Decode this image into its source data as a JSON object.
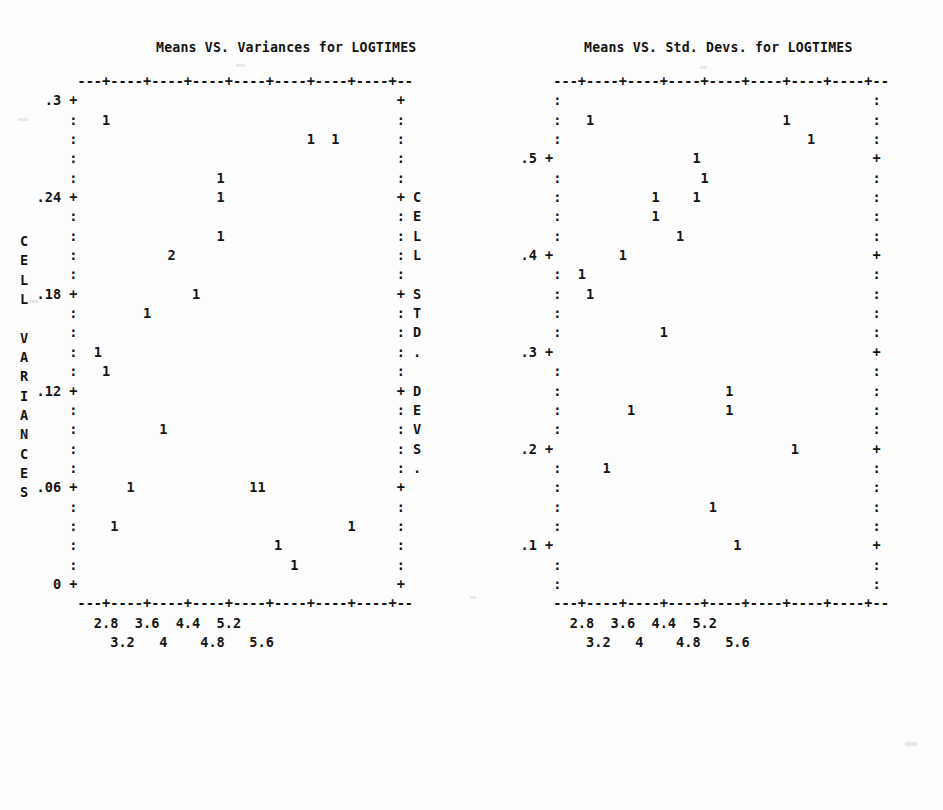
{
  "page": {
    "background_color": "#fdfdfd",
    "ink_color": "#141414",
    "width": 943,
    "height": 810,
    "style": "ascii character plot printout"
  },
  "panels": [
    {
      "id": "left",
      "title": "Means VS. Variances for LOGTIMES",
      "y_axis_label": "CELL VARIANCES",
      "x_axis_label": "",
      "y_ticks": [
        ".3",
        ".24",
        ".18",
        ".12",
        ".06",
        "0"
      ],
      "x_ticks_upper": [
        "2.8",
        "3.6",
        "4.4",
        "5.2"
      ],
      "x_ticks_lower": [
        "3.2",
        "4",
        "4.8",
        "5.6"
      ],
      "plot_text": [
        "        ---+----+----+----+----+----+----+----+--",
        "    .3 +                                       +",
        "       :   1                                   :",
        "       :                            1  1       :",
        "       :                                       :",
        "       :                 1                     :",
        "   .24 +                 1                     + C",
        "       :                                       : E",
        "       :                 1                     : L",
        "       :           2                           : L",
        "       :                                       :",
        "   .18 +              1                        + S",
        "       :        1                              : T",
        "       :                                       : D",
        "       :  1                                    : .",
        "       :   1                                   :",
        "   .12 +                                       + D",
        "       :                                       : E",
        "       :          1                            : V",
        "       :                                       : S",
        "       :                                       : .",
        "   .06 +      1              11                +",
        "       :                                       :",
        "       :    1                            1     :",
        "       :                        1              :",
        "       :                          1            :",
        "     0 +                                       +",
        "        ---+----+----+----+----+----+----+----+--",
        "          2.8  3.6  4.4  5.2",
        "            3.2   4    4.8   5.6"
      ]
    },
    {
      "id": "right",
      "title": "Means VS. Std. Devs. for LOGTIMES",
      "y_axis_label": "",
      "x_axis_label": "",
      "y_ticks": [
        ".5",
        ".4",
        ".3",
        ".2",
        ".1"
      ],
      "x_ticks_upper": [
        "2.8",
        "3.6",
        "4.4",
        "5.2"
      ],
      "x_ticks_lower": [
        "3.2",
        "4",
        "4.8",
        "5.6"
      ],
      "plot_text": [
        "       ---+----+----+----+----+----+----+----+--",
        "       :                                      :",
        "       :   1                       1          :",
        "       :                              1       :",
        "   .5 +                 1                     +",
        "       :                 1                    :",
        "       :           1    1                     :",
        "       :           1                          :",
        "       :              1                       :",
        "   .4 +        1                              +",
        "       :  1                                   :",
        "       :   1                                  :",
        "       :                                      :",
        "       :            1                         :",
        "   .3 +                                       +",
        "       :                                      :",
        "       :                    1                 :",
        "       :        1           1                 :",
        "       :                                      :",
        "   .2 +                             1         +",
        "       :     1                                :",
        "       :                                      :",
        "       :                  1                   :",
        "       :                                      :",
        "   .1 +                      1                +",
        "       :                                      :",
        "       :                                      :",
        "       ---+----+----+----+----+----+----+----+--",
        "         2.8  3.6  4.4  5.2",
        "           3.2   4    4.8   5.6"
      ]
    }
  ],
  "chart_data": [
    {
      "type": "scatter",
      "title": "Means VS. Variances for LOGTIMES",
      "xlabel": "",
      "ylabel": "CELL VARIANCES",
      "xlim": [
        2.6,
        5.8
      ],
      "ylim": [
        0,
        0.3
      ],
      "grid": false,
      "legend": "none",
      "x_tick_labels": [
        "2.8",
        "3.2",
        "3.6",
        "4",
        "4.4",
        "4.8",
        "5.2",
        "5.6"
      ],
      "y_tick_labels": [
        "0",
        ".06",
        ".12",
        ".18",
        ".24",
        ".3"
      ],
      "point_symbol": "1 = one observation, 2 = two observations",
      "points": [
        {
          "x": 2.86,
          "y": 0.288,
          "count": 1
        },
        {
          "x": 5.08,
          "y": 0.276,
          "count": 1
        },
        {
          "x": 5.22,
          "y": 0.276,
          "count": 1
        },
        {
          "x": 4.34,
          "y": 0.252,
          "count": 1
        },
        {
          "x": 4.34,
          "y": 0.24,
          "count": 1
        },
        {
          "x": 4.34,
          "y": 0.216,
          "count": 1
        },
        {
          "x": 3.98,
          "y": 0.204,
          "count": 2
        },
        {
          "x": 4.16,
          "y": 0.18,
          "count": 1
        },
        {
          "x": 3.55,
          "y": 0.168,
          "count": 1
        },
        {
          "x": 2.8,
          "y": 0.144,
          "count": 1
        },
        {
          "x": 2.86,
          "y": 0.132,
          "count": 1
        },
        {
          "x": 3.7,
          "y": 0.096,
          "count": 1
        },
        {
          "x": 3.25,
          "y": 0.06,
          "count": 1
        },
        {
          "x": 4.62,
          "y": 0.06,
          "count": 1
        },
        {
          "x": 4.72,
          "y": 0.06,
          "count": 1
        },
        {
          "x": 3.05,
          "y": 0.036,
          "count": 1
        },
        {
          "x": 5.35,
          "y": 0.036,
          "count": 1
        },
        {
          "x": 4.43,
          "y": 0.024,
          "count": 1
        },
        {
          "x": 4.58,
          "y": 0.012,
          "count": 1
        }
      ]
    },
    {
      "type": "scatter",
      "title": "Means VS. Std. Devs. for LOGTIMES",
      "xlabel": "",
      "ylabel": "CELL STD. DEVS.",
      "xlim": [
        2.6,
        5.8
      ],
      "ylim": [
        0.04,
        0.58
      ],
      "grid": false,
      "legend": "none",
      "x_tick_labels": [
        "2.8",
        "3.2",
        "3.6",
        "4",
        "4.4",
        "4.8",
        "5.2",
        "5.6"
      ],
      "y_tick_labels": [
        ".1",
        ".2",
        ".3",
        ".4",
        ".5"
      ],
      "point_symbol": "1 = one observation",
      "points": [
        {
          "x": 2.86,
          "y": 0.537,
          "count": 1
        },
        {
          "x": 5.08,
          "y": 0.537,
          "count": 1
        },
        {
          "x": 5.22,
          "y": 0.518,
          "count": 1
        },
        {
          "x": 4.34,
          "y": 0.5,
          "count": 1
        },
        {
          "x": 4.34,
          "y": 0.482,
          "count": 1
        },
        {
          "x": 3.98,
          "y": 0.463,
          "count": 1
        },
        {
          "x": 4.16,
          "y": 0.463,
          "count": 1
        },
        {
          "x": 3.98,
          "y": 0.445,
          "count": 1
        },
        {
          "x": 4.16,
          "y": 0.426,
          "count": 1
        },
        {
          "x": 3.55,
          "y": 0.4,
          "count": 1
        },
        {
          "x": 2.8,
          "y": 0.382,
          "count": 1
        },
        {
          "x": 2.86,
          "y": 0.363,
          "count": 1
        },
        {
          "x": 4.05,
          "y": 0.326,
          "count": 1
        },
        {
          "x": 4.62,
          "y": 0.263,
          "count": 1
        },
        {
          "x": 3.7,
          "y": 0.245,
          "count": 1
        },
        {
          "x": 4.62,
          "y": 0.245,
          "count": 1
        },
        {
          "x": 5.35,
          "y": 0.2,
          "count": 1
        },
        {
          "x": 3.25,
          "y": 0.182,
          "count": 1
        },
        {
          "x": 4.43,
          "y": 0.145,
          "count": 1
        },
        {
          "x": 4.58,
          "y": 0.108,
          "count": 1
        }
      ]
    }
  ]
}
